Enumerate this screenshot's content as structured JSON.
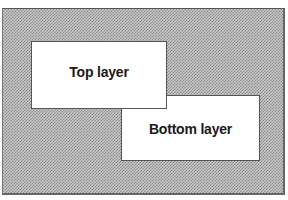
{
  "diagram": {
    "layers": [
      {
        "id": "top",
        "label": "Top layer",
        "stack_order": "front"
      },
      {
        "id": "bottom",
        "label": "Bottom layer",
        "stack_order": "back"
      }
    ],
    "colors": {
      "background_pattern": "#8a8a8a",
      "layer_fill": "#ffffff",
      "text": "#1a1a1a",
      "border": "#555555"
    }
  }
}
